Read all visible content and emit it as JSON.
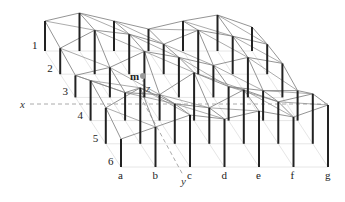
{
  "diagram": {
    "type": "3d-surface-grid-of-posts",
    "columns": [
      "a",
      "b",
      "c",
      "d",
      "e",
      "f",
      "g"
    ],
    "rows": [
      "1",
      "2",
      "3",
      "4",
      "5",
      "6"
    ],
    "point_label": "m",
    "axes": {
      "x": "x",
      "y": "y",
      "z": "z"
    },
    "colors": {
      "post": "#222222",
      "surface_line": "#888888",
      "ground_grid": "#e6e6e6",
      "axis_dashed": "#aaaaaa",
      "point": "#999999"
    },
    "heights": [
      [
        30,
        38,
        30,
        22,
        30,
        36,
        24
      ],
      [
        26,
        44,
        40,
        30,
        44,
        38,
        30
      ],
      [
        22,
        30,
        46,
        40,
        32,
        40,
        34
      ],
      [
        40,
        28,
        26,
        48,
        34,
        30,
        30
      ],
      [
        36,
        56,
        40,
        36,
        54,
        42,
        50
      ],
      [
        28,
        40,
        52,
        48,
        56,
        50,
        62
      ]
    ]
  }
}
